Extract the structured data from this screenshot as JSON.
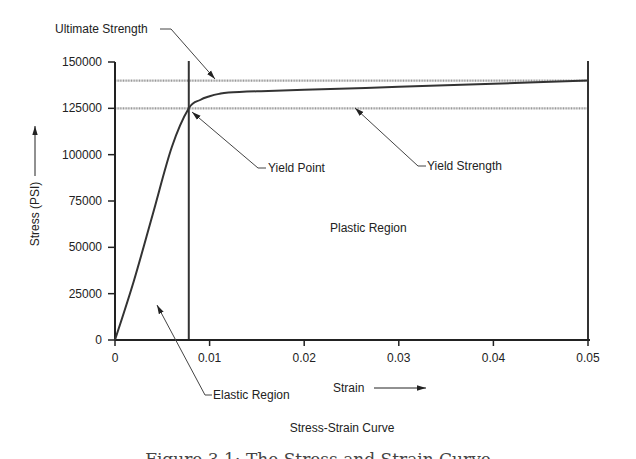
{
  "chart_data": {
    "type": "line",
    "title": "Stress-Strain Curve",
    "xlabel": "Strain",
    "ylabel": "Stress (PSI)",
    "xlim": [
      0,
      0.05
    ],
    "ylim": [
      0,
      150000
    ],
    "x_ticks": [
      "0",
      "0.01",
      "0.02",
      "0.03",
      "0.04",
      "0.05"
    ],
    "y_ticks": [
      "0",
      "25000",
      "50000",
      "75000",
      "100000",
      "125000",
      "150000"
    ],
    "grid": false,
    "series": [
      {
        "name": "Stress-Strain",
        "x": [
          0,
          0.002,
          0.004,
          0.006,
          0.0078,
          0.009,
          0.01,
          0.011,
          0.012,
          0.015,
          0.02,
          0.03,
          0.04,
          0.05
        ],
        "y": [
          0,
          32000,
          68000,
          104000,
          125000,
          129500,
          131500,
          132800,
          133500,
          134200,
          135000,
          136600,
          138300,
          140000
        ]
      }
    ],
    "reference_lines": [
      {
        "name": "Ultimate Strength",
        "orientation": "horizontal",
        "value": 140000
      },
      {
        "name": "Yield Strength",
        "orientation": "horizontal",
        "value": 125000
      },
      {
        "name": "Yield strain",
        "orientation": "vertical",
        "value": 0.0078
      },
      {
        "name": "End strain",
        "orientation": "vertical",
        "value": 0.05
      }
    ],
    "annotations": [
      {
        "text": "Ultimate Strength",
        "points_to": [
          0.019,
          140000
        ]
      },
      {
        "text": "Yield Point",
        "points_to": [
          0.0078,
          125000
        ]
      },
      {
        "text": "Yield Strength",
        "points_to": [
          0.021,
          125000
        ]
      },
      {
        "text": "Plastic Region",
        "at": [
          0.0275,
          60000
        ]
      },
      {
        "text": "Elastic Region",
        "points_to": [
          0.0053,
          20000
        ]
      }
    ]
  },
  "labels": {
    "ultimate": "Ultimate Strength",
    "yield_point": "Yield Point",
    "yield_strength": "Yield Strength",
    "plastic": "Plastic Region",
    "elastic": "Elastic Region",
    "xlabel": "Strain",
    "ylabel": "Stress (PSI)",
    "title": "Stress-Strain Curve",
    "caption": "Figure 3.1: The Stress and Strain Curve"
  }
}
